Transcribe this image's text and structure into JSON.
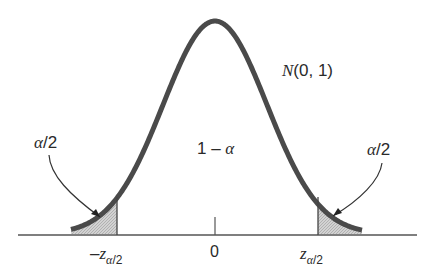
{
  "diagram": {
    "distribution_label": "N(0, 1)",
    "center_label": "1 − α",
    "left_tail_label": "α/2",
    "right_tail_label": "α/2",
    "axis_ticks": {
      "left": {
        "prefix": "−z",
        "sub": "α/2"
      },
      "center": "0",
      "right": {
        "prefix": "z",
        "sub": "α/2"
      }
    },
    "colors": {
      "curve": "#4a4a4a",
      "axis": "#555555",
      "shade": "#c8c8c8",
      "text": "#2a2a2a"
    }
  }
}
